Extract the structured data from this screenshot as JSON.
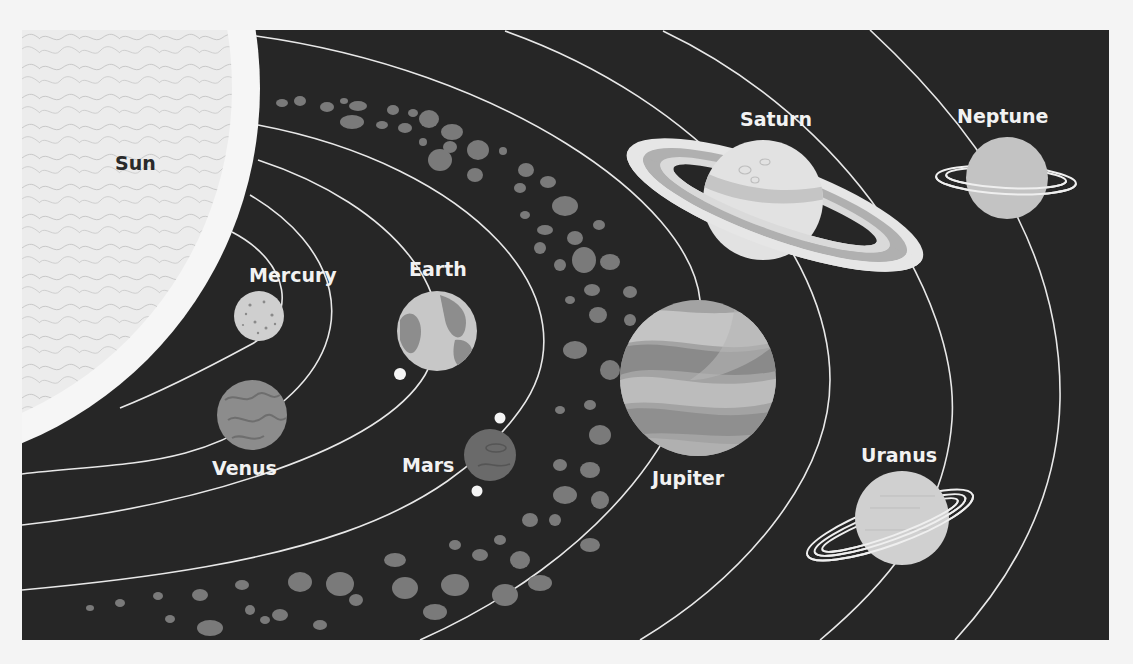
{
  "colors": {
    "background": "#f4f4f4",
    "space": "#262626",
    "orbit": "#e8e8e8",
    "asteroid": "#7a7a7a",
    "label": "#f2f2f2",
    "sun_label": "#2a2a2a"
  },
  "bodies": {
    "sun": {
      "label": "Sun"
    },
    "mercury": {
      "label": "Mercury"
    },
    "venus": {
      "label": "Venus"
    },
    "earth": {
      "label": "Earth"
    },
    "mars": {
      "label": "Mars"
    },
    "jupiter": {
      "label": "Jupiter"
    },
    "saturn": {
      "label": "Saturn"
    },
    "uranus": {
      "label": "Uranus"
    },
    "neptune": {
      "label": "Neptune"
    }
  },
  "regions": {
    "asteroid_belt": {
      "label": ""
    }
  }
}
